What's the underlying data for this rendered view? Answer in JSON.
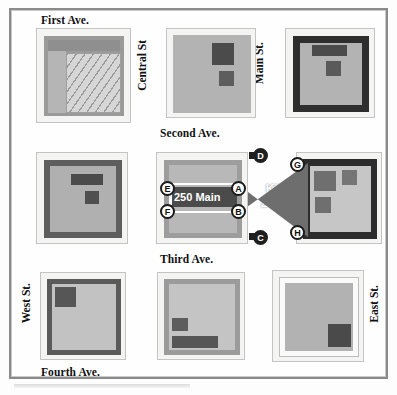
{
  "figure": {
    "kind": "urban-tactical-map",
    "kill_zone_label": "Kill\nZone",
    "kill_zone_line1": "Kill",
    "kill_zone_line2": "Zone",
    "address_label": "250 Main"
  },
  "colors": {
    "frame": "#8a8a8a",
    "page": "#fefefe",
    "lot_light": "#f2f2f0",
    "building_mid": "#b9b9b9",
    "building_light": "#cfcfcf",
    "building_dark": "#6d6d6d",
    "building_darker": "#3a3a3a",
    "outline_dark": "#2b2b2b",
    "kill_zone": "#6e6e6e",
    "marker_fill": "#ffffff",
    "marker_dark": "#1f1f1f",
    "text": "#111111",
    "address_band": "#4b4b4b"
  },
  "streets": {
    "horizontal": [
      {
        "id": "first-ave",
        "label": "First Ave."
      },
      {
        "id": "second-ave",
        "label": "Second Ave."
      },
      {
        "id": "third-ave",
        "label": "Third Ave."
      },
      {
        "id": "fourth-ave",
        "label": "Fourth Ave."
      }
    ],
    "vertical": [
      {
        "id": "west-st",
        "label": "West St."
      },
      {
        "id": "central-st",
        "label": "Central St"
      },
      {
        "id": "main-st",
        "label": "Main St."
      },
      {
        "id": "east-st",
        "label": "East St."
      }
    ]
  },
  "markers": [
    {
      "id": "A",
      "label": "A",
      "style": "light"
    },
    {
      "id": "B",
      "label": "B",
      "style": "light"
    },
    {
      "id": "C",
      "label": "C",
      "style": "dark"
    },
    {
      "id": "D",
      "label": "D",
      "style": "dark"
    },
    {
      "id": "E",
      "label": "E",
      "style": "light"
    },
    {
      "id": "F",
      "label": "F",
      "style": "light"
    },
    {
      "id": "G",
      "label": "G",
      "style": "light"
    },
    {
      "id": "H",
      "label": "H",
      "style": "light"
    }
  ],
  "blocks": [
    {
      "id": "block-nw",
      "name": "northwest-block",
      "note": "hatched courtyard"
    },
    {
      "id": "block-nc",
      "name": "north-central-block",
      "note": "two dark roof units"
    },
    {
      "id": "block-ne",
      "name": "northeast-block",
      "note": "thick dark wall, two units"
    },
    {
      "id": "block-mw",
      "name": "mid-west-block",
      "note": "dark wall, bar + square unit"
    },
    {
      "id": "block-target",
      "name": "target-block-250-main",
      "note": "objective building 250 Main"
    },
    {
      "id": "block-me",
      "name": "mid-east-block",
      "note": "three units, markers G and H"
    },
    {
      "id": "block-sw",
      "name": "southwest-block",
      "note": "dark square upper-left"
    },
    {
      "id": "block-sc",
      "name": "south-central-block",
      "note": "square + long bar units"
    },
    {
      "id": "block-se",
      "name": "southeast-block",
      "note": "dark square lower-right"
    }
  ]
}
